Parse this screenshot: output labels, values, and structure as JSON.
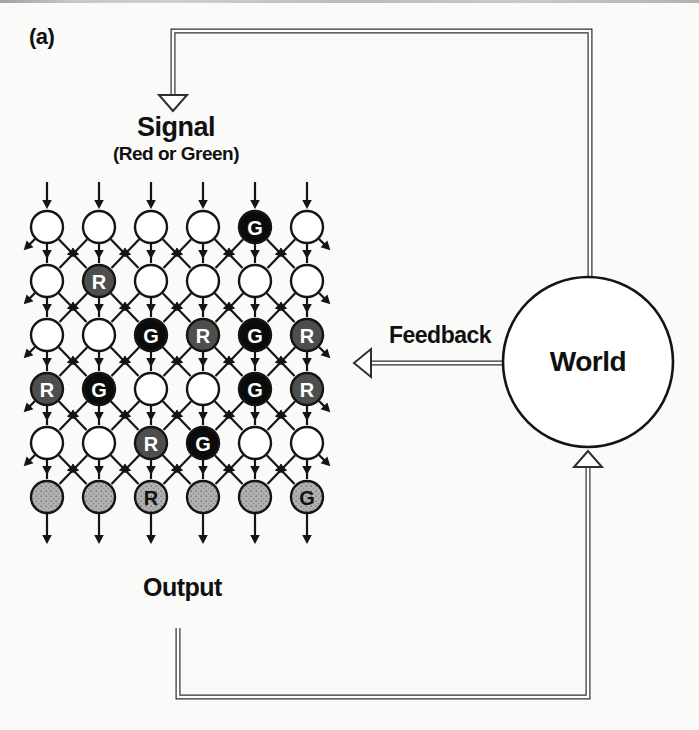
{
  "labels": {
    "panel": "(a)",
    "signal_title": "Signal",
    "signal_subtitle": "(Red or Green)",
    "feedback": "Feedback",
    "world": "World",
    "output": "Output"
  },
  "colors": {
    "background": "#fafaf8",
    "line": "#141414",
    "loop": "#2e2e2e",
    "node_white": "#ffffff",
    "r_fill": "#4e4e4e",
    "g_fill": "#0b0b0b",
    "output_fill": "#b2b2b2",
    "output_dot": "#7a7a7a",
    "letter_light": "#ffffff",
    "letter_dark": "#111111"
  },
  "grid": {
    "cols_x": [
      47,
      99,
      151,
      203,
      255,
      307
    ],
    "rows_y": [
      227,
      281,
      335,
      389,
      443,
      497
    ],
    "node_radius": 16,
    "entry_arrow_top_y": 182,
    "exit_arrow_bottom_y": 539,
    "nodes": [
      [
        "",
        "",
        "",
        "",
        "G",
        ""
      ],
      [
        "",
        "R",
        "",
        "",
        "",
        ""
      ],
      [
        "",
        "",
        "G",
        "R",
        "G",
        "R"
      ],
      [
        "R",
        "G",
        "",
        "",
        "G",
        "R"
      ],
      [
        "",
        "",
        "R",
        "G",
        "",
        ""
      ],
      [
        "O",
        "O",
        "OR",
        "O",
        "O",
        "OG"
      ]
    ]
  },
  "world": {
    "cx": 588,
    "cy": 362,
    "r": 85
  },
  "loops": {
    "signal_path": "M 173 95 L 173 31 L 590 31 L 590 279",
    "output_path": "M 178 628 L 178 697 L 588 697 L 588 466",
    "feedback_path": "M 502 363 L 371 363",
    "signal_head": "173,111 159,95 187,95",
    "world_in_head": "588,451 574,467 602,467",
    "feedback_head": "354,363 371,349 371,377"
  }
}
